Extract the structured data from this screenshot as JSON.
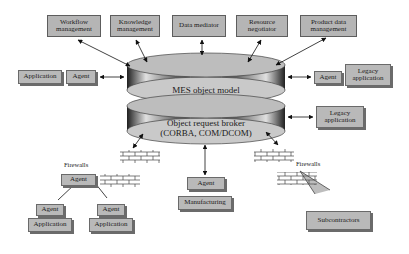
{
  "top_modules": [
    {
      "label": "Workflow management"
    },
    {
      "label": "Knowledge management"
    },
    {
      "label": "Data mediator"
    },
    {
      "label": "Resource negotiator"
    },
    {
      "label": "Product data management"
    }
  ],
  "cylinders": {
    "mes": "MES object model",
    "orb_line1": "Object request broker",
    "orb_line2": "(CORBA, COM/DCOM)"
  },
  "left_side": {
    "application": "Application",
    "agent": "Agent"
  },
  "right_side": {
    "agent": "Agent",
    "legacy1": "Legacy application",
    "legacy2": "Legacy application"
  },
  "bottom_left": {
    "firewalls": "Firewalls",
    "agent_top": "Agent",
    "agent_left": "Agent",
    "agent_right": "Agent",
    "application_left": "Application",
    "application_right": "Application"
  },
  "bottom_center": {
    "agent": "Agent",
    "manufacturing": "Manufacturing"
  },
  "bottom_right": {
    "firewalls": "Firewalls",
    "subcontractors": "Subcontractors"
  },
  "colors": {
    "box_fill": "#b9b9b9",
    "cylinder_top": "#c8c8c8",
    "cylinder_side": "#555555"
  }
}
